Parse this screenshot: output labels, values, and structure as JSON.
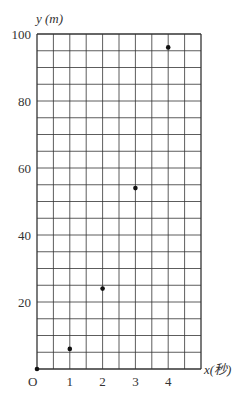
{
  "chart_data": {
    "type": "scatter",
    "title": "",
    "xlabel": "x(秒)",
    "ylabel": "y (m)",
    "origin_label": "O",
    "x": [
      0,
      1,
      2,
      3,
      4
    ],
    "series": [
      {
        "name": "y",
        "values": [
          0,
          6,
          24,
          54,
          96
        ]
      }
    ],
    "xlim": [
      0,
      5
    ],
    "ylim": [
      0,
      100
    ],
    "x_ticks": [
      1,
      2,
      3,
      4
    ],
    "y_ticks": [
      20,
      40,
      60,
      80,
      100
    ],
    "x_minor_step": 0.5,
    "y_minor_step": 5,
    "grid": true,
    "legend": "none",
    "colors": {
      "grid": "#333333",
      "point": "#111111",
      "text": "#333333"
    }
  }
}
